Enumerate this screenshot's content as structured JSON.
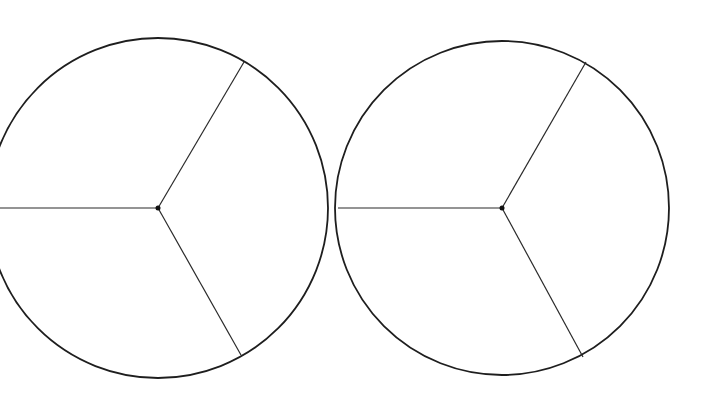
{
  "diagram": {
    "stroke_color": "#1e1e1e",
    "background": "#ffffff",
    "circles": [
      {
        "name": "left-circle",
        "center": [
          158,
          208
        ],
        "radius": 170,
        "clipped_left": true,
        "spokes": [
          [
            0,
            208
          ],
          [
            244,
            62
          ],
          [
            241,
            355
          ]
        ],
        "sectors": 3
      },
      {
        "name": "right-circle",
        "center": [
          502,
          208
        ],
        "radius": 167,
        "clipped_left": false,
        "spokes": [
          [
            338,
            208
          ],
          [
            586,
            62
          ],
          [
            583,
            357
          ]
        ],
        "sectors": 3
      }
    ]
  }
}
